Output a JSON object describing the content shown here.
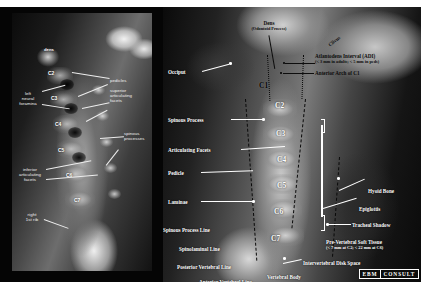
{
  "figure": {
    "panels": [
      "oblique-view",
      "lateral-view"
    ]
  },
  "oblique": {
    "labels": {
      "pedicles": "pedicles",
      "superior_facets": "superior\narticulating\nfacets",
      "spinous_processes": "spinous\nprocesses",
      "left_neural_foramina": "left\nneural\nforamina",
      "inferior_facets": "inferior\narticulating\nfacets",
      "right_first_rib": "right\n1st rib",
      "dens": "dens"
    },
    "vertebrae": [
      "C2",
      "C3",
      "C4",
      "C5",
      "C6",
      "C7"
    ]
  },
  "lateral": {
    "vertebrae": [
      "C1",
      "C2",
      "C3",
      "C4",
      "C5",
      "C6",
      "C7"
    ],
    "labels": {
      "dens": "Dens",
      "dens_sub": "(Odontoid Process)",
      "clivus": "Clivus",
      "adi": "Atlantodens Interval (ADI)",
      "adi_sub": "(< 3 mm in adults; < 5 mm in peds)",
      "anterior_arch": "Anterior Arch of C1",
      "occiput": "Occiput",
      "spinous_process": "Spinous Process",
      "articulating_facets": "Articulating Facets",
      "pedicle": "Pedicle",
      "laminae": "Laminae",
      "spinous_process_line": "Spinous Process Line",
      "spinolaminal_line": "Spinolaminal Line",
      "posterior_vertebral_line": "Posterior Vertebral Line",
      "anterior_vertebral_line": "Anterior Vertebral Line",
      "hyoid_bone": "Hyoid Bone",
      "epiglottis": "Epiglottis",
      "tracheal_shadow": "Tracheal Shadow",
      "prevertebral_soft_tissue": "Pre-Vertebral Soft Tissue",
      "prevertebral_sub": "(< 7 mm at C2;  < 22 mm at C6)",
      "intervertebral_disk_space": "Intervertebral Disk Space",
      "vertebral_body": "Vertebral Body"
    }
  },
  "logo": {
    "part1": "EBM",
    "part2": "CONSULT"
  },
  "colors": {
    "label_light": "#ffffff",
    "label_dark": "#0b0b0b",
    "background": "#000000",
    "page": "#ffffff"
  }
}
